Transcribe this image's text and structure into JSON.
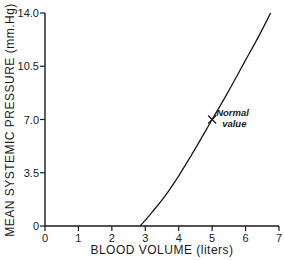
{
  "chart_data": {
    "type": "line",
    "title": "",
    "xlabel": "BLOOD VOLUME (liters)",
    "ylabel": "MEAN SYSTEMIC PRESSURE (mm.Hg)",
    "xlim": [
      0,
      7
    ],
    "ylim": [
      0,
      14
    ],
    "x_ticks": [
      "0",
      "1",
      "2",
      "3",
      "4",
      "5",
      "6",
      "7"
    ],
    "y_ticks": [
      "0",
      "3.5",
      "7.0",
      "10.5",
      "14.0"
    ],
    "grid": false,
    "legend": null,
    "series": [
      {
        "name": "Mean systemic pressure",
        "x": [
          2.85,
          3.2,
          3.6,
          4.0,
          4.5,
          5.0,
          5.5,
          6.0,
          6.4,
          6.75
        ],
        "y": [
          0.0,
          0.9,
          2.0,
          3.3,
          5.1,
          7.0,
          8.9,
          10.9,
          12.5,
          14.0
        ]
      }
    ],
    "annotations": [
      {
        "text_line1": "Normal",
        "text_line2": "value",
        "x": 5.0,
        "y": 7.0,
        "marker": "x"
      }
    ]
  }
}
